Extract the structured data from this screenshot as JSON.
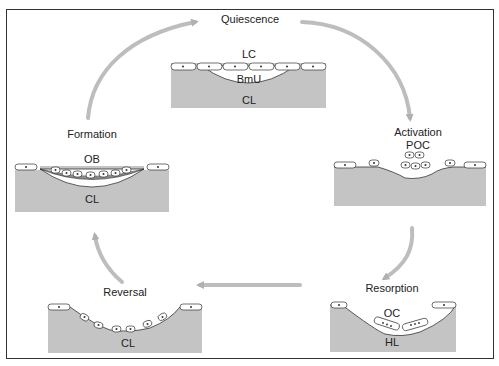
{
  "figure": {
    "phases": [
      {
        "id": "quiescence",
        "label": "Quiescence",
        "annotations": [
          "LC",
          "BmU",
          "CL"
        ]
      },
      {
        "id": "activation",
        "label": "Activation",
        "annotations": [
          "POC"
        ]
      },
      {
        "id": "resorption",
        "label": "Resorption",
        "annotations": [
          "OC",
          "HL"
        ]
      },
      {
        "id": "reversal",
        "label": "Reversal",
        "annotations": [
          "CL"
        ]
      },
      {
        "id": "formation",
        "label": "Formation",
        "annotations": [
          "OB",
          "CL"
        ]
      }
    ],
    "arrow_order": [
      "Quiescence",
      "Activation",
      "Resorption",
      "Reversal",
      "Formation",
      "Quiescence"
    ],
    "colors": {
      "bone": "#c4c4c4",
      "arrow": "#b8b8b8",
      "line": "#333333",
      "new_bone": "#8a8a8a"
    }
  }
}
